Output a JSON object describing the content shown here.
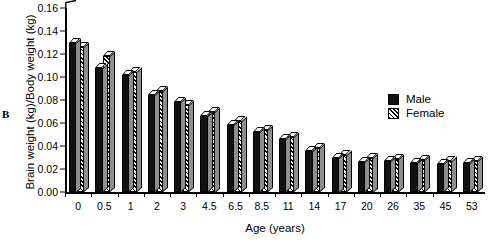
{
  "panel_label": "B",
  "chart_data": {
    "type": "bar",
    "title": "",
    "xlabel": "Age (years)",
    "ylabel": "Brain weight (kg)/Body weight (kg)",
    "categories": [
      "0",
      "0.5",
      "1",
      "2",
      "3",
      "4.5",
      "6.5",
      "8.5",
      "11",
      "14",
      "17",
      "20",
      "26",
      "35",
      "45",
      "53"
    ],
    "series": [
      {
        "name": "Male",
        "color": "#111111",
        "pattern": "solid",
        "values": [
          0.13,
          0.108,
          0.102,
          0.084,
          0.078,
          0.066,
          0.058,
          0.052,
          0.046,
          0.036,
          0.03,
          0.026,
          0.027,
          0.025,
          0.024,
          0.025
        ]
      },
      {
        "name": "Female",
        "color": "#ffffff",
        "pattern": "diagonal-hatch",
        "values": [
          0.126,
          0.118,
          0.104,
          0.088,
          0.076,
          0.07,
          0.062,
          0.054,
          0.048,
          0.038,
          0.032,
          0.03,
          0.029,
          0.028,
          0.027,
          0.027
        ]
      }
    ],
    "ylim": [
      0.0,
      0.16
    ],
    "yticks": [
      "0.00",
      "0.02",
      "0.04",
      "0.06",
      "0.08",
      "0.10",
      "0.12",
      "0.14",
      "0.16"
    ],
    "ytick_values": [
      0.0,
      0.02,
      0.04,
      0.06,
      0.08,
      0.1,
      0.12,
      0.14,
      0.16
    ],
    "grid": false,
    "legend_position": "top-right",
    "style": "3d-bars"
  },
  "legend": {
    "items": [
      {
        "label": "Male",
        "swatch": "male"
      },
      {
        "label": "Female",
        "swatch": "female"
      }
    ]
  }
}
